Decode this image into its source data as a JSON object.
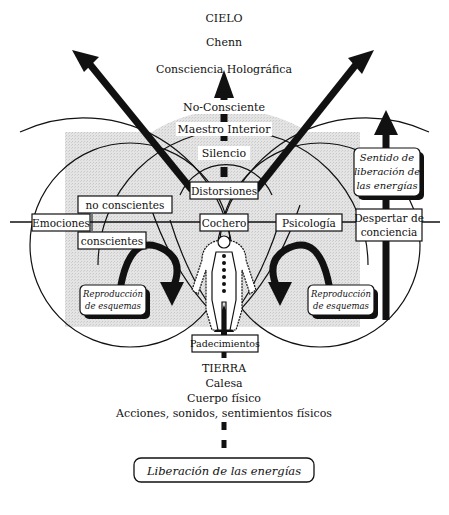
{
  "top": {
    "cielo": "CIELO",
    "chenn": "Chenn",
    "consciencia": "Consciencia Holográfica",
    "no_consciente": "No-Consciente",
    "maestro": "Maestro Interior",
    "silencio": "Silencio"
  },
  "center": {
    "distorsiones": "Distorsiones",
    "cochero": "Cochero",
    "padecimientos": "Padecimientos"
  },
  "left": {
    "no_conscientes": "no conscientes",
    "emociones": "Emociones",
    "conscientes": "conscientes",
    "reproduccion_line1": "Reproducción",
    "reproduccion_line2": "de esquemas"
  },
  "right": {
    "psicologia": "Psicología",
    "despertar_line1": "Despertar de",
    "despertar_line2": "conciencia",
    "sentido_line1": "Sentido de",
    "sentido_line2": "liberación de",
    "sentido_line3": "las energías",
    "reproduccion_line1": "Reproducción",
    "reproduccion_line2": "de esquemas"
  },
  "bottom": {
    "tierra": "TIERRA",
    "calesa": "Calesa",
    "cuerpo": "Cuerpo físico",
    "acciones": "Acciones, sonidos, sentimientos físicos",
    "liberacion": "Liberación de las energías"
  },
  "colors": {
    "ink": "#111111",
    "shade": "#dcdcdc",
    "paper": "#ffffff"
  }
}
